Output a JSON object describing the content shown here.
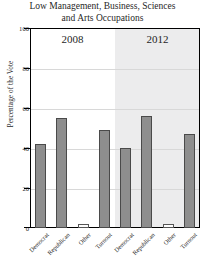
{
  "chart_data": {
    "type": "bar",
    "title": "Low Management, Business, Sciences and Arts Occupations",
    "title_lines": [
      "Low Management, Business, Sciences",
      "and Arts Occupations"
    ],
    "xlabel": "",
    "ylabel": "Percentage of the Vote",
    "ylim": [
      0,
      100
    ],
    "yticks": [
      0,
      20,
      40,
      60,
      80,
      100
    ],
    "grid": true,
    "legend": "none",
    "panels": [
      {
        "label": "2008",
        "categories": [
          "Democrat",
          "Republican",
          "Other",
          "Turnout"
        ],
        "values": [
          42,
          55,
          2,
          49
        ]
      },
      {
        "label": "2012",
        "categories": [
          "Democrat",
          "Republican",
          "Other",
          "Turnout"
        ],
        "values": [
          40,
          56,
          2,
          47
        ]
      }
    ],
    "colors": {
      "bar_fill": "#8e8e8e",
      "bar_fill_light": "#fdfdfd",
      "bar_outline": "#4a4a4a",
      "panel_2008_bg": "#ffffff",
      "panel_2012_bg": "#ececed",
      "gridline": "#d8d8d8",
      "axis": "#000000"
    }
  },
  "yticklabels": {
    "t0": "0",
    "t20": "20",
    "t40": "40",
    "t60": "60",
    "t80": "80",
    "t100": "100"
  }
}
